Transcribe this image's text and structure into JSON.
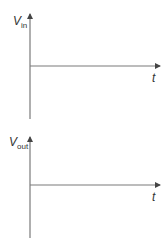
{
  "plots": [
    {
      "id": "input",
      "y_label_main": "V",
      "y_label_sub": "in",
      "x_label": "t",
      "axis_color": "#7a7a7a"
    },
    {
      "id": "output",
      "y_label_main": "V",
      "y_label_sub": "out",
      "x_label": "t",
      "axis_color": "#7a7a7a"
    }
  ]
}
